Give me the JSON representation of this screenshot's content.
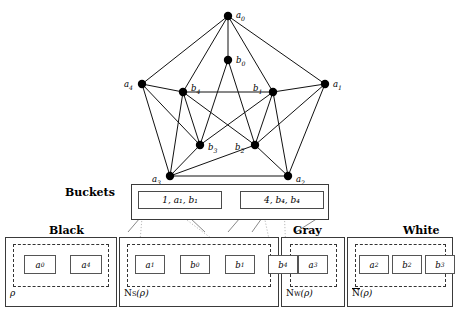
{
  "figure": {
    "graph": {
      "name": "petersen-graph",
      "outer_nodes": [
        {
          "id": "a0",
          "label": "a",
          "sub": "0",
          "x": 228,
          "y": 16,
          "lx": 236,
          "ly": 10
        },
        {
          "id": "a1",
          "label": "a",
          "sub": "1",
          "x": 325,
          "y": 84,
          "lx": 333,
          "ly": 79
        },
        {
          "id": "a2",
          "label": "a",
          "sub": "2",
          "x": 288,
          "y": 176,
          "lx": 296,
          "ly": 174
        },
        {
          "id": "a3",
          "label": "a",
          "sub": "3",
          "x": 170,
          "y": 176,
          "lx": 152,
          "ly": 174
        },
        {
          "id": "a4",
          "label": "a",
          "sub": "4",
          "x": 142,
          "y": 84,
          "lx": 124,
          "ly": 79
        }
      ],
      "inner_nodes": [
        {
          "id": "b0",
          "label": "b",
          "sub": "0",
          "x": 228,
          "y": 60,
          "lx": 236,
          "ly": 55
        },
        {
          "id": "b1",
          "label": "b",
          "sub": "1",
          "x": 273,
          "y": 92,
          "lx": 253,
          "ly": 83
        },
        {
          "id": "b2",
          "label": "b",
          "sub": "2",
          "x": 255,
          "y": 145,
          "lx": 235,
          "ly": 142
        },
        {
          "id": "b3",
          "label": "b",
          "sub": "3",
          "x": 200,
          "y": 145,
          "lx": 208,
          "ly": 142
        },
        {
          "id": "b4",
          "label": "b",
          "sub": "4",
          "x": 183,
          "y": 92,
          "lx": 191,
          "ly": 83
        }
      ],
      "edges": [
        [
          "a0",
          "a1"
        ],
        [
          "a1",
          "a2"
        ],
        [
          "a2",
          "a3"
        ],
        [
          "a3",
          "a4"
        ],
        [
          "a4",
          "a0"
        ],
        [
          "a0",
          "b0"
        ],
        [
          "a1",
          "b1"
        ],
        [
          "a2",
          "b2"
        ],
        [
          "a3",
          "b3"
        ],
        [
          "a4",
          "b4"
        ],
        [
          "b0",
          "b2"
        ],
        [
          "b2",
          "b4"
        ],
        [
          "b4",
          "b1"
        ],
        [
          "b1",
          "b3"
        ],
        [
          "b3",
          "b0"
        ],
        [
          "a0",
          "b4"
        ],
        [
          "a0",
          "b1"
        ],
        [
          "a4",
          "b4"
        ],
        [
          "a1",
          "b1"
        ],
        [
          "a4",
          "b3"
        ],
        [
          "a3",
          "b4"
        ],
        [
          "a2",
          "b2"
        ],
        [
          "b4",
          "b2"
        ],
        [
          "b4",
          "b1"
        ],
        [
          "b4",
          "b3"
        ],
        [
          "a1",
          "b2"
        ],
        [
          "a2",
          "b1"
        ],
        [
          "a3",
          "b2"
        ],
        [
          "b1",
          "b2"
        ]
      ]
    },
    "buckets": {
      "title": "Buckets",
      "cells": [
        {
          "id": "bucket-cell-1",
          "text": "1, a₁, b₁"
        },
        {
          "id": "bucket-cell-2",
          "text": "4, b₄, b₄"
        }
      ]
    },
    "groups": [
      {
        "id": "black",
        "header": "Black",
        "footer_plain": "ρ",
        "footer_sub": "",
        "overline": false,
        "items": [
          {
            "label": "a",
            "sub": "0"
          },
          {
            "label": "a",
            "sub": "4"
          }
        ],
        "chains": [
          [
            0,
            1
          ]
        ]
      },
      {
        "id": "ns-rho",
        "header": "",
        "footer_plain": "N",
        "footer_sub": "S",
        "footer_tail": "(ρ)",
        "overline": false,
        "items": [
          {
            "label": "a",
            "sub": "1"
          },
          {
            "label": "b",
            "sub": "0"
          },
          {
            "label": "b",
            "sub": "1"
          },
          {
            "label": "b",
            "sub": "4"
          }
        ],
        "chains": [
          [
            0,
            1
          ],
          [
            1,
            2
          ]
        ]
      },
      {
        "id": "gray",
        "header": "Gray",
        "footer_plain": "N",
        "footer_sub": "W",
        "footer_tail": "(ρ)",
        "overline": false,
        "items": [
          {
            "label": "a",
            "sub": "3"
          }
        ],
        "chains": []
      },
      {
        "id": "white",
        "header": "White",
        "footer_plain": "N",
        "footer_sub": "",
        "footer_tail": "(ρ)",
        "overline": true,
        "items": [
          {
            "label": "a",
            "sub": "2"
          },
          {
            "label": "b",
            "sub": "2"
          },
          {
            "label": "b",
            "sub": "3"
          }
        ],
        "chains": [
          [
            0,
            1
          ],
          [
            1,
            2
          ]
        ]
      }
    ]
  }
}
